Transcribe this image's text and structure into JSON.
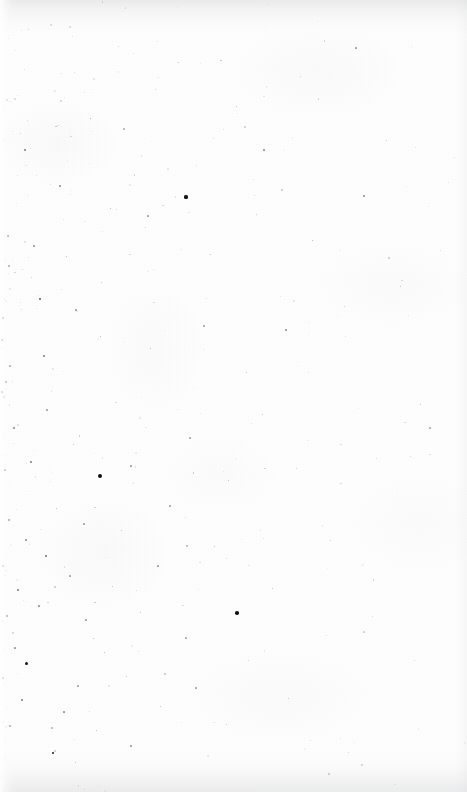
{
  "page": {
    "kind": "scanned-blank-page",
    "width": 467,
    "height": 792,
    "text_content": "",
    "visible_text_count": 0,
    "paper_color": "#fdfdfd",
    "speck_color_dark": "#1a1a1a",
    "speck_color_mid": "#6e6f73",
    "speck_color_light": "#b9babe",
    "edge_shadow_color": "#b2b4b8"
  },
  "header": {
    "text": ""
  },
  "footer": {
    "page_number": ""
  },
  "marks": {
    "note": "Dust and ink specks, densest toward the lower-left quadrant, sparsest along the right margin.",
    "prominent": [
      {
        "name": "dark-speck-upper-left",
        "x": 186,
        "y": 197,
        "size": 3.2,
        "color": "#161616"
      },
      {
        "name": "dark-speck-mid-left",
        "x": 100,
        "y": 476,
        "size": 4.2,
        "color": "#101010"
      },
      {
        "name": "dark-speck-lower-mid",
        "x": 237,
        "y": 613,
        "size": 3.6,
        "color": "#131313"
      },
      {
        "name": "dark-speck-left-edge",
        "x": 26,
        "y": 663,
        "size": 3.0,
        "color": "#1b1b1b"
      },
      {
        "name": "dark-speck-lower-left",
        "x": 53,
        "y": 753,
        "size": 2.8,
        "color": "#1d1d1d"
      }
    ],
    "scatter": [
      {
        "x": 25,
        "y": 150,
        "s": 1.4,
        "c": "#8a8b8f"
      },
      {
        "x": 90,
        "y": 118,
        "s": 1.0,
        "c": "#a8a9ad"
      },
      {
        "x": 264,
        "y": 150,
        "s": 1.2,
        "c": "#9a9b9f"
      },
      {
        "x": 178,
        "y": 62,
        "s": 1.0,
        "c": "#b0b1b5"
      },
      {
        "x": 356,
        "y": 48,
        "s": 1.1,
        "c": "#a4a5a9"
      },
      {
        "x": 118,
        "y": 46,
        "s": 0.9,
        "c": "#b4b5b9"
      },
      {
        "x": 8,
        "y": 236,
        "s": 1.3,
        "c": "#94959a"
      },
      {
        "x": 34,
        "y": 246,
        "s": 1.1,
        "c": "#a0a1a5"
      },
      {
        "x": 66,
        "y": 256,
        "s": 1.0,
        "c": "#aeafb3"
      },
      {
        "x": 9,
        "y": 266,
        "s": 1.2,
        "c": "#9b9ca0"
      },
      {
        "x": 40,
        "y": 299,
        "s": 1.8,
        "c": "#5c5d61"
      },
      {
        "x": 101,
        "y": 282,
        "s": 1.0,
        "c": "#b2b3b7"
      },
      {
        "x": 3,
        "y": 318,
        "s": 1.4,
        "c": "#8e8f93"
      },
      {
        "x": 76,
        "y": 310,
        "s": 1.1,
        "c": "#a6a7ab"
      },
      {
        "x": 2,
        "y": 340,
        "s": 1.6,
        "c": "#7f8084"
      },
      {
        "x": 44,
        "y": 356,
        "s": 1.5,
        "c": "#86878b"
      },
      {
        "x": 10,
        "y": 366,
        "s": 1.2,
        "c": "#9d9ea2"
      },
      {
        "x": 100,
        "y": 336,
        "s": 1.0,
        "c": "#b1b2b6"
      },
      {
        "x": 6,
        "y": 382,
        "s": 1.3,
        "c": "#949599"
      },
      {
        "x": 2,
        "y": 392,
        "s": 1.7,
        "c": "#76777b"
      },
      {
        "x": 47,
        "y": 410,
        "s": 1.1,
        "c": "#a9aaae"
      },
      {
        "x": 14,
        "y": 428,
        "s": 1.2,
        "c": "#9fa0a4"
      },
      {
        "x": 73,
        "y": 444,
        "s": 1.0,
        "c": "#b3b4b8"
      },
      {
        "x": 31,
        "y": 462,
        "s": 1.4,
        "c": "#8b8c90"
      },
      {
        "x": 5,
        "y": 470,
        "s": 1.2,
        "c": "#9c9da1"
      },
      {
        "x": 62,
        "y": 470,
        "s": 1.5,
        "c": "#82838７"
      },
      {
        "x": 131,
        "y": 466,
        "s": 1.1,
        "c": "#a5a6aa"
      },
      {
        "x": 20,
        "y": 500,
        "s": 1.3,
        "c": "#90919５"
      },
      {
        "x": 56,
        "y": 508,
        "s": 1.0,
        "c": "#b0b1b5"
      },
      {
        "x": 9,
        "y": 520,
        "s": 1.4,
        "c": "#8d8e92"
      },
      {
        "x": 84,
        "y": 524,
        "s": 1.1,
        "c": "#a7a8ac"
      },
      {
        "x": 26,
        "y": 540,
        "s": 1.2,
        "c": "#9b9ca0"
      },
      {
        "x": 121,
        "y": 530,
        "s": 1.0,
        "c": "#b2b3b7"
      },
      {
        "x": 46,
        "y": 556,
        "s": 1.6,
        "c": "#7d7e82"
      },
      {
        "x": 3,
        "y": 566,
        "s": 1.3,
        "c": "#96979b"
      },
      {
        "x": 70,
        "y": 576,
        "s": 1.1,
        "c": "#a8a9ad"
      },
      {
        "x": 18,
        "y": 590,
        "s": 1.5,
        "c": "#85868a"
      },
      {
        "x": 112,
        "y": 586,
        "s": 1.0,
        "c": "#b1b2b6"
      },
      {
        "x": 39,
        "y": 606,
        "s": 1.2,
        "c": "#9a9b9f"
      },
      {
        "x": 7,
        "y": 616,
        "s": 1.4,
        "c": "#8c8d91"
      },
      {
        "x": 86,
        "y": 620,
        "s": 1.1,
        "c": "#a6a7ab"
      },
      {
        "x": 140,
        "y": 612,
        "s": 1.0,
        "c": "#b3b4b8"
      },
      {
        "x": 60,
        "y": 636,
        "s": 1.3,
        "c": "#93949８"
      },
      {
        "x": 15,
        "y": 648,
        "s": 1.2,
        "c": "#9e9fa3"
      },
      {
        "x": 104,
        "y": 652,
        "s": 1.0,
        "c": "#aeafb3"
      },
      {
        "x": 44,
        "y": 668,
        "s": 1.5,
        "c": "#83848８"
      },
      {
        "x": 3,
        "y": 678,
        "s": 1.3,
        "c": "#97989c"
      },
      {
        "x": 78,
        "y": 686,
        "s": 1.1,
        "c": "#a9aaae"
      },
      {
        "x": 126,
        "y": 676,
        "s": 1.0,
        "c": "#b2b3b7"
      },
      {
        "x": 22,
        "y": 700,
        "s": 1.4,
        "c": "#8a8b8f"
      },
      {
        "x": 64,
        "y": 712,
        "s": 1.2,
        "c": "#9c9da1"
      },
      {
        "x": 10,
        "y": 726,
        "s": 1.1,
        "c": "#a7a8ac"
      },
      {
        "x": 96,
        "y": 730,
        "s": 1.0,
        "c": "#b0b1b5"
      },
      {
        "x": 36,
        "y": 744,
        "s": 1.3,
        "c": "#91929６"
      },
      {
        "x": 131,
        "y": 746,
        "s": 1.1,
        "c": "#a5a6aa"
      },
      {
        "x": 75,
        "y": 762,
        "s": 1.0,
        "c": "#b1b2b6"
      },
      {
        "x": 160,
        "y": 706,
        "s": 1.0,
        "c": "#b4b5b9"
      },
      {
        "x": 196,
        "y": 688,
        "s": 1.1,
        "c": "#aaabaf"
      },
      {
        "x": 214,
        "y": 722,
        "s": 0.9,
        "c": "#b6b7bb"
      },
      {
        "x": 150,
        "y": 348,
        "s": 1.0,
        "c": "#b0b1b5"
      },
      {
        "x": 204,
        "y": 326,
        "s": 1.1,
        "c": "#a8a9ad"
      },
      {
        "x": 246,
        "y": 372,
        "s": 1.0,
        "c": "#b2b3b7"
      },
      {
        "x": 286,
        "y": 330,
        "s": 1.2,
        "c": "#9fa0a4"
      },
      {
        "x": 262,
        "y": 414,
        "s": 1.0,
        "c": "#b3b4b8"
      },
      {
        "x": 190,
        "y": 438,
        "s": 1.1,
        "c": "#abacb0"
      },
      {
        "x": 228,
        "y": 480,
        "s": 1.0,
        "c": "#b2b3b7"
      },
      {
        "x": 170,
        "y": 506,
        "s": 1.1,
        "c": "#a9aaae"
      },
      {
        "x": 296,
        "y": 468,
        "s": 0.9,
        "c": "#b7b8bc"
      },
      {
        "x": 214,
        "y": 546,
        "s": 1.0,
        "c": "#b0b1b5"
      },
      {
        "x": 158,
        "y": 566,
        "s": 1.1,
        "c": "#a6a7ab"
      },
      {
        "x": 272,
        "y": 588,
        "s": 1.0,
        "c": "#b3b4b8"
      },
      {
        "x": 186,
        "y": 638,
        "s": 1.1,
        "c": "#aaabaf"
      },
      {
        "x": 248,
        "y": 660,
        "s": 0.9,
        "c": "#b6b7bb"
      },
      {
        "x": 312,
        "y": 240,
        "s": 1.0,
        "c": "#b2b3b7"
      },
      {
        "x": 364,
        "y": 196,
        "s": 1.2,
        "c": "#9d9ea2"
      },
      {
        "x": 400,
        "y": 286,
        "s": 1.0,
        "c": "#b4b5b9"
      },
      {
        "x": 344,
        "y": 306,
        "s": 0.9,
        "c": "#b8b9bd"
      },
      {
        "x": 420,
        "y": 404,
        "s": 1.0,
        "c": "#b3b4b8"
      },
      {
        "x": 430,
        "y": 428,
        "s": 1.1,
        "c": "#adaeb2"
      },
      {
        "x": 386,
        "y": 140,
        "s": 1.0,
        "c": "#b2b3b7"
      },
      {
        "x": 236,
        "y": 106,
        "s": 1.0,
        "c": "#b4b5b9"
      },
      {
        "x": 300,
        "y": 76,
        "s": 0.9,
        "c": "#b9babe"
      },
      {
        "x": 148,
        "y": 216,
        "s": 1.1,
        "c": "#a8a9ad"
      },
      {
        "x": 110,
        "y": 208,
        "s": 1.0,
        "c": "#b1b2b6"
      },
      {
        "x": 60,
        "y": 186,
        "s": 1.2,
        "c": "#9b9ca0"
      },
      {
        "x": 210,
        "y": 254,
        "s": 1.0,
        "c": "#b2b3b7"
      },
      {
        "x": 256,
        "y": 214,
        "s": 0.9,
        "c": "#b7b8bc"
      },
      {
        "x": 330,
        "y": 540,
        "s": 1.0,
        "c": "#b4b5b9"
      },
      {
        "x": 372,
        "y": 616,
        "s": 0.9,
        "c": "#b8b9bd"
      },
      {
        "x": 288,
        "y": 698,
        "s": 1.0,
        "c": "#b3b4b8"
      },
      {
        "x": 348,
        "y": 752,
        "s": 0.9,
        "c": "#b9babe"
      },
      {
        "x": 414,
        "y": 660,
        "s": 0.9,
        "c": "#babbbf"
      }
    ]
  }
}
